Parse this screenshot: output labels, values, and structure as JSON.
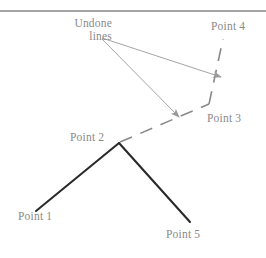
{
  "figure": {
    "width": 266,
    "height": 258,
    "background": "#ffffff",
    "top_rule": {
      "present": true,
      "y": 11,
      "color": "#4a4a4a"
    },
    "colors": {
      "label_text": "#8a8a8a",
      "solid_line": "#2a2a2a",
      "dashed_line": "#8a8a8a",
      "arrow": "#9a9a9a",
      "rule": "#4a4a4a"
    },
    "annotation": {
      "line1": "Undone",
      "line2": "lines"
    },
    "labels": [
      {
        "id": "point1",
        "text": "Point 1"
      },
      {
        "id": "point2",
        "text": "Point 2"
      },
      {
        "id": "point3",
        "text": "Point 3"
      },
      {
        "id": "point4",
        "text": "Point 4"
      },
      {
        "id": "point5",
        "text": "Point 5"
      }
    ],
    "geometry": {
      "points": {
        "point1": {
          "x": 36,
          "y": 211
        },
        "point2": {
          "x": 119,
          "y": 143
        },
        "point3": {
          "x": 209,
          "y": 104
        },
        "point4": {
          "x": 222,
          "y": 40
        },
        "point5": {
          "x": 190,
          "y": 222
        }
      },
      "solid_segments": [
        {
          "name": "point1-point2",
          "from": "point1",
          "to": "point2"
        },
        {
          "name": "point2-point5",
          "from": "point2",
          "to": "point5"
        }
      ],
      "dashed_segments": [
        {
          "name": "point2-point3",
          "from": "point2",
          "to": "point3"
        },
        {
          "name": "point3-point4",
          "from": "point3",
          "to": "point4"
        }
      ],
      "arrows": [
        {
          "name": "arrow-to-point3-point4-dash",
          "from": {
            "x": 102,
            "y": 38
          },
          "to": {
            "x": 221,
            "y": 77
          }
        },
        {
          "name": "arrow-to-point2-point3-dash",
          "from": {
            "x": 102,
            "y": 39
          },
          "to": {
            "x": 179,
            "y": 117
          }
        }
      ]
    }
  }
}
